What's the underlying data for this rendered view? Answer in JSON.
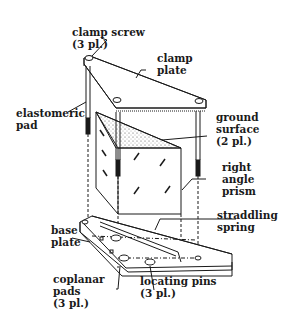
{
  "diagram": {
    "type": "mechanical-assembly",
    "labels": {
      "clamp_screw": {
        "line1": "clamp screw",
        "line2": "(3 pl.)"
      },
      "clamp_plate": {
        "line1": "clamp",
        "line2": "plate"
      },
      "elastomeric_pad": {
        "line1": "elastomeric",
        "line2": "pad"
      },
      "ground_surface": {
        "line1": "ground",
        "line2": "surface",
        "line3": "(2 pl.)"
      },
      "right_angle_prism": {
        "line1": "right",
        "line2": "angle",
        "line3": "prism"
      },
      "straddling_spring": {
        "line1": "straddling",
        "line2": "spring"
      },
      "base_plate": {
        "line1": "base",
        "line2": "plate"
      },
      "coplanar_pads": {
        "line1": "coplanar",
        "line2": "pads",
        "line3": "(3 pl.)"
      },
      "locating_pins": {
        "line1": "locating pins",
        "line2": "(3 pl.)"
      }
    },
    "colors": {
      "ink": "#1a1a1a",
      "background": "#ffffff"
    }
  }
}
